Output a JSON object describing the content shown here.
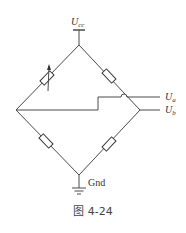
{
  "labels": {
    "supply": "U",
    "supply_sub": "cc",
    "output_a": "U",
    "output_a_sub": "a",
    "output_b": "U",
    "output_b_sub": "b",
    "ground": "Gnd"
  },
  "caption": "图 4-24",
  "components": [
    {
      "id": "R1",
      "type": "variable-resistor",
      "branch": "top-left"
    },
    {
      "id": "R2",
      "type": "resistor",
      "branch": "top-right"
    },
    {
      "id": "R3",
      "type": "resistor",
      "branch": "bottom-left"
    },
    {
      "id": "R4",
      "type": "resistor",
      "branch": "bottom-right"
    }
  ],
  "colors": {
    "wire": "#4a4a4a",
    "text": "#333333"
  }
}
